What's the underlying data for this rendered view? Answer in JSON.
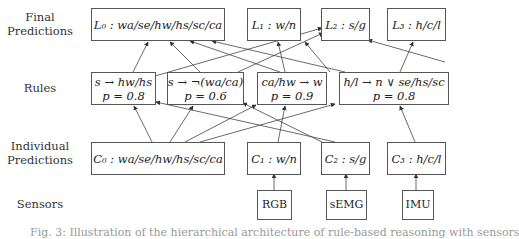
{
  "row_labels": {
    "final": "Final Predictions",
    "final_line1": "Final",
    "final_line2": "Predictions",
    "rules": "Rules",
    "individual_line1": "Individual",
    "individual_line2": "Predictions",
    "sensors": "Sensors"
  },
  "final_predictions": [
    {
      "id": "L0",
      "label": "L₀ : wa/se/hw/hs/sc/ca"
    },
    {
      "id": "L1",
      "label": "L₁ : w/n"
    },
    {
      "id": "L2",
      "label": "L₂ : s/g"
    },
    {
      "id": "L3",
      "label": "L₃ : h/c/l"
    }
  ],
  "rules": [
    {
      "id": "R0",
      "rule": "s → hw/hs",
      "prob": "p = 0.8"
    },
    {
      "id": "R1",
      "rule": "s → ¬(wa/ca)",
      "prob": "p = 0.6"
    },
    {
      "id": "R2",
      "rule": "ca/hw → w",
      "prob": "p = 0.9"
    },
    {
      "id": "R3",
      "rule": "h/l → n ∨ se/hs/sc",
      "prob": "p = 0.8"
    }
  ],
  "individual_predictions": [
    {
      "id": "C0",
      "label": "C₀ : wa/se/hw/hs/sc/ca"
    },
    {
      "id": "C1",
      "label": "C₁ : w/n"
    },
    {
      "id": "C2",
      "label": "C₂ : s/g"
    },
    {
      "id": "C3",
      "label": "C₃ : h/c/l"
    }
  ],
  "sensors": [
    {
      "id": "RGB",
      "label": "RGB"
    },
    {
      "id": "sEMG",
      "label": "sEMG"
    },
    {
      "id": "IMU",
      "label": "IMU"
    }
  ],
  "caption": "Fig. 3: Illustration of the hierarchical architecture of rule-based reasoning with sensors",
  "colors": {
    "line": "#444444",
    "box_border": "#555555",
    "text": "#222222"
  }
}
